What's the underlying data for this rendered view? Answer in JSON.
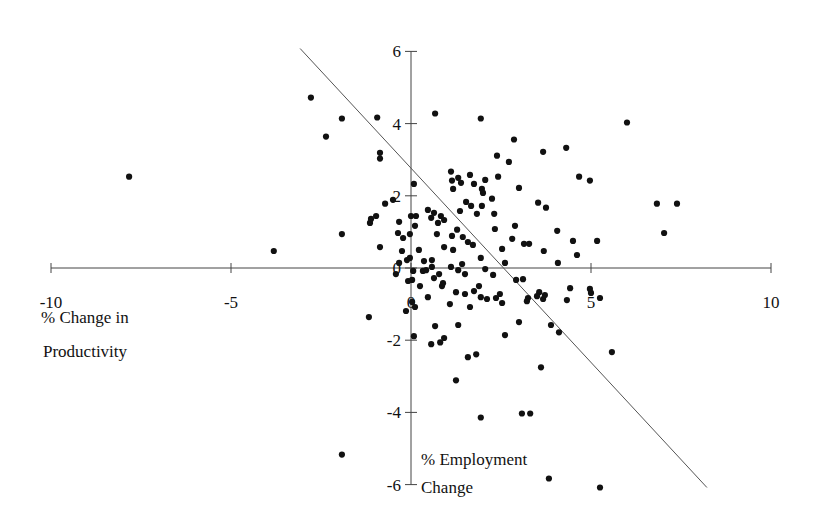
{
  "chart_data": {
    "type": "scatter",
    "title": "",
    "xlabel": "% Change in Productivity",
    "ylabel": "% Employment Change",
    "xlabel_lines": [
      "% Change in",
      "Productivity"
    ],
    "ylabel_lines": [
      "% Employment",
      "Change"
    ],
    "xlim": [
      -10,
      10
    ],
    "ylim": [
      -6,
      6
    ],
    "x_ticks": [
      -10,
      -5,
      0,
      5,
      10
    ],
    "y_ticks": [
      6,
      4,
      2,
      0,
      -2,
      -4,
      -6
    ],
    "grid": false,
    "legend": null,
    "trend_line": {
      "x": [
        -3.08,
        8.22
      ],
      "y": [
        6.08,
        -6.08
      ]
    },
    "series": [
      {
        "name": "observations",
        "points": [
          [
            -7.83,
            2.53
          ],
          [
            -3.81,
            0.47
          ],
          [
            -2.78,
            4.72
          ],
          [
            -2.36,
            3.64
          ],
          [
            -1.92,
            4.14
          ],
          [
            -1.92,
            0.94
          ],
          [
            -1.92,
            -5.17
          ],
          [
            -1.17,
            -1.36
          ],
          [
            -0.94,
            4.17
          ],
          [
            -0.86,
            3.19
          ],
          [
            -0.86,
            3.03
          ],
          [
            -0.72,
            1.78
          ],
          [
            -0.97,
            1.44
          ],
          [
            -1.14,
            1.25
          ],
          [
            -1.11,
            1.36
          ],
          [
            -0.5,
            1.89
          ],
          [
            -0.86,
            0.58
          ],
          [
            -0.33,
            1.28
          ],
          [
            -0.36,
            0.97
          ],
          [
            -0.22,
            0.83
          ],
          [
            -0.33,
            0.14
          ],
          [
            -0.25,
            0.47
          ],
          [
            -0.42,
            -0.17
          ],
          [
            -0.11,
            0.22
          ],
          [
            -0.08,
            -0.36
          ],
          [
            -0.14,
            -1.19
          ],
          [
            0.11,
            -1.08
          ],
          [
            0.03,
            -0.94
          ],
          [
            0.08,
            -1.89
          ],
          [
            -0.03,
            0.28
          ],
          [
            0.08,
            2.33
          ],
          [
            0.0,
            1.44
          ],
          [
            0.14,
            1.44
          ],
          [
            0.11,
            1.17
          ],
          [
            -0.03,
            0.94
          ],
          [
            0.22,
            0.5
          ],
          [
            0.36,
            0.19
          ],
          [
            0.33,
            -0.08
          ],
          [
            0.06,
            -0.08
          ],
          [
            0.58,
            0.22
          ],
          [
            0.67,
            4.28
          ],
          [
            0.47,
            1.61
          ],
          [
            0.56,
            1.39
          ],
          [
            0.64,
            1.53
          ],
          [
            0.75,
            1.25
          ],
          [
            0.83,
            1.44
          ],
          [
            0.92,
            1.33
          ],
          [
            0.72,
            0.94
          ],
          [
            0.92,
            0.58
          ],
          [
            0.58,
            0.03
          ],
          [
            0.64,
            -0.28
          ],
          [
            0.78,
            -0.17
          ],
          [
            0.86,
            -0.5
          ],
          [
            0.89,
            -0.42
          ],
          [
            0.47,
            -0.81
          ],
          [
            0.67,
            -1.61
          ],
          [
            0.81,
            -2.06
          ],
          [
            0.92,
            -1.94
          ],
          [
            0.56,
            -2.11
          ],
          [
            1.08,
            -1.0
          ],
          [
            1.11,
            2.67
          ],
          [
            1.14,
            2.42
          ],
          [
            1.17,
            2.19
          ],
          [
            1.31,
            2.5
          ],
          [
            1.39,
            2.36
          ],
          [
            1.64,
            2.58
          ],
          [
            1.75,
            2.33
          ],
          [
            1.97,
            2.19
          ],
          [
            2.0,
            2.08
          ],
          [
            1.97,
            1.72
          ],
          [
            1.83,
            1.5
          ],
          [
            1.67,
            1.72
          ],
          [
            1.53,
            1.83
          ],
          [
            1.36,
            1.58
          ],
          [
            1.28,
            1.06
          ],
          [
            1.14,
            0.89
          ],
          [
            1.44,
            0.86
          ],
          [
            1.58,
            0.72
          ],
          [
            1.72,
            0.64
          ],
          [
            1.17,
            0.5
          ],
          [
            1.11,
            0.03
          ],
          [
            1.31,
            -0.06
          ],
          [
            1.42,
            0.11
          ],
          [
            1.5,
            -0.17
          ],
          [
            1.94,
            0.28
          ],
          [
            2.06,
            -0.03
          ],
          [
            1.25,
            -0.67
          ],
          [
            1.5,
            -0.72
          ],
          [
            1.75,
            -0.64
          ],
          [
            1.94,
            -0.81
          ],
          [
            2.11,
            -0.86
          ],
          [
            1.89,
            -0.5
          ],
          [
            1.31,
            -1.58
          ],
          [
            1.58,
            -2.47
          ],
          [
            1.25,
            -3.11
          ],
          [
            1.94,
            -4.14
          ],
          [
            1.81,
            -2.39
          ],
          [
            1.64,
            -1.08
          ],
          [
            2.47,
            -0.72
          ],
          [
            2.36,
            -0.83
          ],
          [
            2.53,
            -0.97
          ],
          [
            2.28,
            -0.19
          ],
          [
            2.61,
            0.14
          ],
          [
            2.53,
            0.53
          ],
          [
            2.33,
            1.08
          ],
          [
            2.31,
            1.5
          ],
          [
            2.25,
            1.92
          ],
          [
            2.42,
            2.53
          ],
          [
            2.06,
            2.44
          ],
          [
            2.39,
            3.11
          ],
          [
            2.86,
            3.56
          ],
          [
            2.72,
            2.94
          ],
          [
            3.0,
            2.22
          ],
          [
            2.89,
            1.17
          ],
          [
            2.81,
            0.81
          ],
          [
            3.14,
            0.67
          ],
          [
            3.28,
            0.67
          ],
          [
            2.92,
            -0.33
          ],
          [
            3.11,
            -0.31
          ],
          [
            3.25,
            -0.83
          ],
          [
            3.0,
            -1.5
          ],
          [
            2.61,
            -1.86
          ],
          [
            3.22,
            -0.92
          ],
          [
            3.56,
            -0.67
          ],
          [
            3.67,
            -0.86
          ],
          [
            3.5,
            -0.78
          ],
          [
            3.72,
            -0.75
          ],
          [
            3.89,
            -1.58
          ],
          [
            4.11,
            -1.78
          ],
          [
            3.61,
            -2.75
          ],
          [
            3.08,
            -4.03
          ],
          [
            3.31,
            -4.03
          ],
          [
            3.83,
            -5.83
          ],
          [
            3.67,
            3.22
          ],
          [
            4.31,
            3.33
          ],
          [
            3.53,
            1.81
          ],
          [
            3.75,
            1.67
          ],
          [
            4.06,
            1.03
          ],
          [
            4.61,
            0.36
          ],
          [
            4.5,
            0.75
          ],
          [
            3.69,
            0.47
          ],
          [
            4.08,
            0.14
          ],
          [
            4.42,
            -0.56
          ],
          [
            4.33,
            -0.89
          ],
          [
            4.97,
            -0.58
          ],
          [
            5.0,
            -0.69
          ],
          [
            5.25,
            -0.83
          ],
          [
            4.67,
            2.53
          ],
          [
            4.97,
            2.42
          ],
          [
            5.17,
            0.75
          ],
          [
            5.58,
            -2.33
          ],
          [
            6.0,
            4.03
          ],
          [
            6.83,
            1.78
          ],
          [
            7.39,
            1.78
          ],
          [
            7.03,
            0.97
          ],
          [
            5.25,
            -6.08
          ],
          [
            1.94,
            4.14
          ],
          [
            0.03,
            -0.33
          ],
          [
            0.42,
            -0.06
          ],
          [
            0.25,
            -0.5
          ]
        ]
      }
    ]
  },
  "plot_area": {
    "origin_px": [
      411,
      268
    ],
    "px_per_unit_x": 36.0,
    "px_per_unit_y": 36.1
  }
}
